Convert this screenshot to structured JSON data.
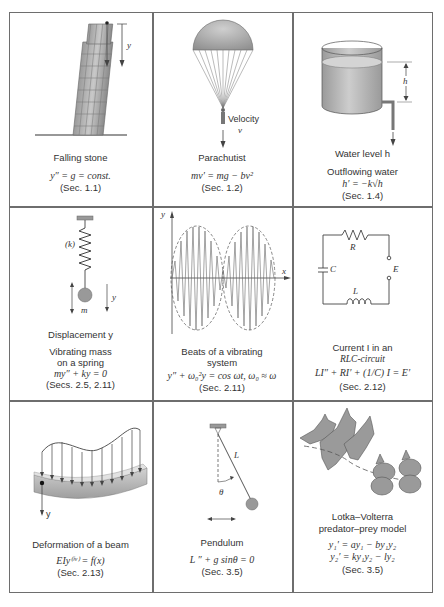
{
  "figure": {
    "layout": "3x3 grid",
    "panels": [
      {
        "id": "falling-stone",
        "diagram_labels": [
          "y"
        ],
        "title": "Falling stone",
        "equation": "y″ = g = const.",
        "section": "(Sec. 1.1)"
      },
      {
        "id": "parachutist",
        "diagram_labels": [
          "Velocity",
          "v"
        ],
        "title": "Parachutist",
        "equation": "mv′ = mg − bv²",
        "section": "(Sec. 1.2)"
      },
      {
        "id": "outflowing-water",
        "diagram_labels": [
          "h"
        ],
        "caption": "Water level h",
        "title": "Outflowing water",
        "equation": "h′ = −k√h",
        "section": "(Sec. 1.4)"
      },
      {
        "id": "vibrating-mass",
        "diagram_labels": [
          "(k)",
          "y",
          "m"
        ],
        "caption": "Displacement y",
        "title_line1": "Vibrating mass",
        "title_line2": "on a spring",
        "equation": "my″ + ky = 0",
        "section": "(Secs. 2.5, 2.11)"
      },
      {
        "id": "beats",
        "diagram_labels": [
          "y",
          "x"
        ],
        "title_line1": "Beats of a vibrating",
        "title_line2": "system",
        "equation": "y″ + ω₀²y = cos ωt,   ω₀ ≈ ω",
        "section": "(Sec. 2.11)"
      },
      {
        "id": "rlc-circuit",
        "diagram_labels": [
          "R",
          "C",
          "E",
          "L"
        ],
        "title_line1": "Current I in an",
        "title_line2": "RLC-circuit",
        "equation": "LI″ + RI′ + (1/C) I = E′",
        "section": "(Sec. 2.12)"
      },
      {
        "id": "beam",
        "diagram_labels": [
          "y"
        ],
        "title": "Deformation of a beam",
        "equation": "EIy⁽ⁱᵛ⁾ = f(x)",
        "section": "(Sec. 2.13)"
      },
      {
        "id": "pendulum",
        "diagram_labels": [
          "L",
          "θ"
        ],
        "title": "Pendulum",
        "equation": "L  ″ + g sinθ = 0",
        "section": "(Sec. 3.5)"
      },
      {
        "id": "lotka-volterra",
        "title_line1": "Lotka–Volterra",
        "title_line2": "predator–prey model",
        "equation_1": "y₁′ = ay₁ − by₁y₂",
        "equation_2": "y₂′ = ky₁y₂ − ly₂",
        "section": "(Sec. 3.5)"
      }
    ]
  },
  "colors": {
    "border": "#6e6e6e",
    "shade_dark": "#8a8a8a",
    "shade_mid": "#b0b0b0",
    "shade_light": "#d6d6d6",
    "text": "#333333"
  }
}
